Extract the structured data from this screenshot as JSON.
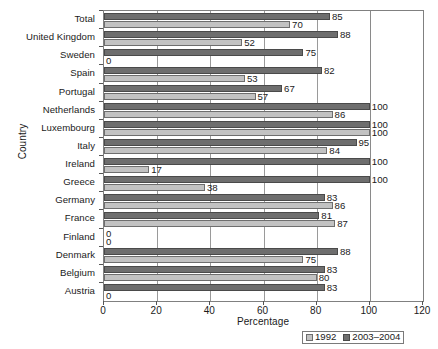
{
  "chart_data": {
    "type": "bar",
    "orientation": "horizontal",
    "title": "",
    "xlabel": "Percentage",
    "ylabel": "Country",
    "xlim": [
      0,
      120
    ],
    "ylim": null,
    "grid": true,
    "legend_position": "bottom-right",
    "xticks": [
      0,
      20,
      40,
      60,
      80,
      100,
      120
    ],
    "xtick_labels": [
      "0",
      "20",
      "40",
      "60",
      "80",
      "100",
      "120"
    ],
    "categories": [
      "Total",
      "United Kingdom",
      "Sweden",
      "Spain",
      "Portugal",
      "Netherlands",
      "Luxembourg",
      "Italy",
      "Ireland",
      "Greece",
      "Germany",
      "France",
      "Finland",
      "Denmark",
      "Belgium",
      "Austria"
    ],
    "series": [
      {
        "name": "1992",
        "color": "#c2c2c2",
        "values": [
          70,
          52,
          0,
          53,
          57,
          86,
          100,
          84,
          17,
          38,
          86,
          87,
          0,
          75,
          80,
          0
        ]
      },
      {
        "name": "2003–2004",
        "color": "#6e6e6e",
        "values": [
          85,
          88,
          75,
          82,
          67,
          100,
          100,
          95,
          100,
          100,
          83,
          81,
          0,
          88,
          83,
          83
        ]
      }
    ],
    "data_labels": {
      "Total": {
        "1992": "70",
        "2003–2004": "85"
      },
      "United Kingdom": {
        "1992": "52",
        "2003–2004": "88"
      },
      "Sweden": {
        "1992": "0",
        "2003–2004": "75"
      },
      "Spain": {
        "1992": "53",
        "2003–2004": "82"
      },
      "Portugal": {
        "1992": "57",
        "2003–2004": "67"
      },
      "Netherlands": {
        "1992": "86",
        "2003–2004": "100"
      },
      "Luxembourg": {
        "1992": "100",
        "2003–2004": "100"
      },
      "Italy": {
        "1992": "84",
        "2003–2004": "95"
      },
      "Ireland": {
        "1992": "17",
        "2003–2004": "100"
      },
      "Greece": {
        "1992": "38",
        "2003–2004": "100"
      },
      "Germany": {
        "1992": "86",
        "2003–2004": "83"
      },
      "France": {
        "1992": "87",
        "2003–2004": "81"
      },
      "Finland": {
        "1992": "0",
        "2003–2004": "0"
      },
      "Denmark": {
        "1992": "75",
        "2003–2004": "88"
      },
      "Belgium": {
        "1992": "80",
        "2003–2004": "83"
      },
      "Austria": {
        "1992": "0",
        "2003–2004": "83"
      }
    }
  },
  "legend": {
    "entries": [
      {
        "label": "1992",
        "color": "#c2c2c2"
      },
      {
        "label": "2003–2004",
        "color": "#6e6e6e"
      }
    ]
  },
  "axes": {
    "x_title": "Percentage",
    "y_title": "Country"
  }
}
